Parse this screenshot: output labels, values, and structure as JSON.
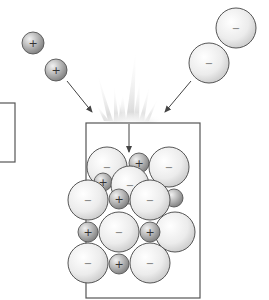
{
  "diagram": {
    "colors": {
      "background": "#ffffff",
      "outline": "#555555",
      "arrow": "#444444",
      "cation_light": "#e6e6e6",
      "cation_dark": "#8a8a8a",
      "anion_light": "#ffffff",
      "anion_dark": "#c4c4c4",
      "burst": "#cccccc"
    },
    "symbols": {
      "cation": "+",
      "anion": "−"
    },
    "incoming_cations": [
      {
        "id": "cation-1",
        "cx": 33,
        "cy": 43,
        "r": 11,
        "sign": "+"
      },
      {
        "id": "cation-2",
        "cx": 56,
        "cy": 70,
        "r": 11,
        "sign": "+"
      }
    ],
    "incoming_anions": [
      {
        "id": "anion-1",
        "cx": 236,
        "cy": 28,
        "r": 20,
        "sign": "−"
      },
      {
        "id": "anion-2",
        "cx": 209,
        "cy": 63,
        "r": 20,
        "sign": "−"
      }
    ],
    "arrows": [
      {
        "id": "arrow-cations-in",
        "x1": 67,
        "y1": 81,
        "x2": 92,
        "y2": 112
      },
      {
        "id": "arrow-anions-in",
        "x1": 191,
        "y1": 81,
        "x2": 165,
        "y2": 112
      },
      {
        "id": "arrow-down-into-crystal",
        "x1": 129,
        "y1": 124,
        "x2": 129,
        "y2": 152
      }
    ],
    "crystal_box": {
      "x": 86,
      "y": 123,
      "width": 114,
      "height": 175
    },
    "side_box": {
      "x": -2,
      "y": 103,
      "width": 17,
      "height": 59
    },
    "crystal_ions": [
      {
        "type": "anion",
        "cx": 175,
        "cy": 232,
        "r": 20,
        "sign": ""
      },
      {
        "type": "cation",
        "cx": 174,
        "cy": 198,
        "r": 9,
        "sign": ""
      },
      {
        "type": "anion",
        "cx": 107,
        "cy": 167,
        "r": 20,
        "sign": "−"
      },
      {
        "type": "cation",
        "cx": 139,
        "cy": 163,
        "r": 10,
        "sign": "+"
      },
      {
        "type": "anion",
        "cx": 169,
        "cy": 167,
        "r": 20,
        "sign": "−"
      },
      {
        "type": "cation",
        "cx": 103,
        "cy": 182,
        "r": 9,
        "sign": "+"
      },
      {
        "type": "anion",
        "cx": 130,
        "cy": 185,
        "r": 19,
        "sign": "−"
      },
      {
        "type": "anion",
        "cx": 88,
        "cy": 200,
        "r": 20,
        "sign": "−"
      },
      {
        "type": "cation",
        "cx": 119,
        "cy": 199,
        "r": 10,
        "sign": "+"
      },
      {
        "type": "anion",
        "cx": 150,
        "cy": 200,
        "r": 20,
        "sign": "−"
      },
      {
        "type": "cation",
        "cx": 88,
        "cy": 232,
        "r": 10,
        "sign": "+"
      },
      {
        "type": "anion",
        "cx": 119,
        "cy": 232,
        "r": 20,
        "sign": "−"
      },
      {
        "type": "cation",
        "cx": 150,
        "cy": 232,
        "r": 10,
        "sign": "+"
      },
      {
        "type": "anion",
        "cx": 88,
        "cy": 263,
        "r": 20,
        "sign": "−"
      },
      {
        "type": "cation",
        "cx": 119,
        "cy": 264,
        "r": 10,
        "sign": "+"
      },
      {
        "type": "anion",
        "cx": 150,
        "cy": 263,
        "r": 20,
        "sign": "−"
      }
    ]
  }
}
